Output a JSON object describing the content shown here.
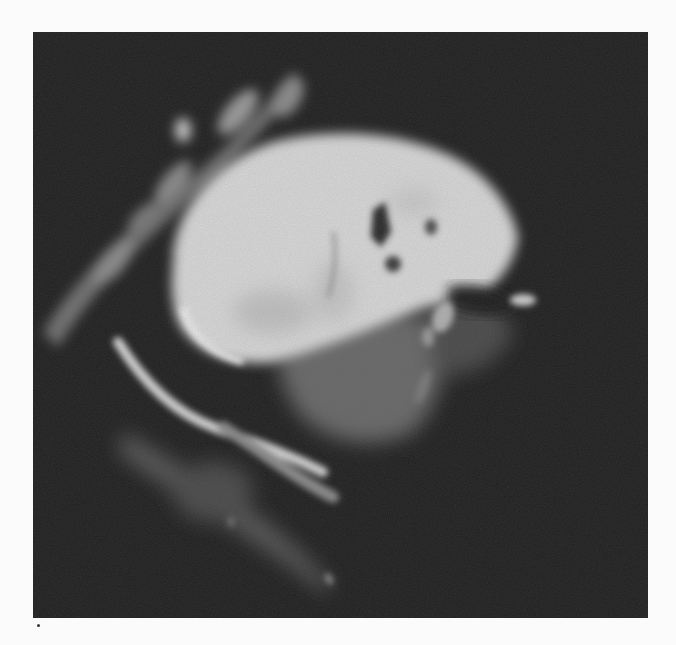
{
  "figure": {
    "type": "grayscale-scan",
    "description": "Sagittal-like grayscale MR image of a large bright ovoid mass with adjacent darker lobulated tissue and curved bright linear structures",
    "colors": {
      "page_background": "#fbfbfb",
      "panel_background": "#222222",
      "bright_tissue": "#d9d9d9",
      "mid_tissue": "#6a6a6a",
      "dark_void": "#1a1a1a"
    },
    "structures": [
      {
        "id": "bright-mass",
        "label": "large bright ovoid mass"
      },
      {
        "id": "intermediate-lobule",
        "label": "intermediate-signal lobulated region below mass"
      },
      {
        "id": "upper-left-band",
        "label": "curved band of bright fragments at upper left"
      },
      {
        "id": "lower-curved-stripe",
        "label": "curved bright stripe beneath mass"
      },
      {
        "id": "lower-faint-band",
        "label": "faint elongated band at lower left"
      },
      {
        "id": "small-bright-foci",
        "label": "small bright foci at right margin"
      }
    ]
  }
}
